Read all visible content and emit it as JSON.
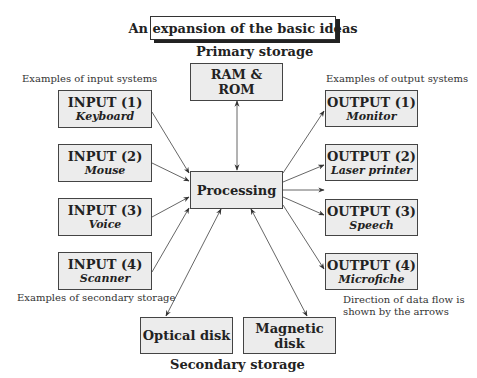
{
  "title": "An expansion of the basic ideas",
  "primary_storage": {
    "heading": "Primary storage",
    "box": "RAM & ROM"
  },
  "processing": "Processing",
  "inputs": {
    "caption": "Examples of input systems",
    "items": [
      {
        "title": "INPUT (1)",
        "subtitle": "Keyboard"
      },
      {
        "title": "INPUT (2)",
        "subtitle": "Mouse"
      },
      {
        "title": "INPUT (3)",
        "subtitle": "Voice"
      },
      {
        "title": "INPUT (4)",
        "subtitle": "Scanner"
      }
    ]
  },
  "outputs": {
    "caption": "Examples of output systems",
    "items": [
      {
        "title": "OUTPUT (1)",
        "subtitle": "Monitor"
      },
      {
        "title": "OUTPUT (2)",
        "subtitle": "Laser printer"
      },
      {
        "title": "OUTPUT (3)",
        "subtitle": "Speech"
      },
      {
        "title": "OUTPUT (4)",
        "subtitle": "Microfiche"
      }
    ]
  },
  "secondary_storage": {
    "caption": "Examples of secondary storage",
    "heading": "Secondary storage",
    "items": [
      "Optical disk",
      "Magnetic disk"
    ]
  },
  "note": {
    "line1": "Direction of data flow is",
    "line2": "shown by the arrows"
  },
  "colors": {
    "box_fill": "#ececec",
    "border": "#444444",
    "arrow": "#333333"
  }
}
